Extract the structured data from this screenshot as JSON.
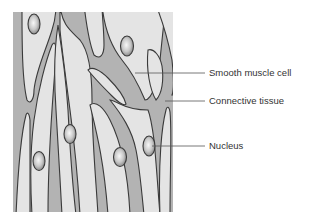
{
  "diagram": {
    "colors": {
      "connective_tissue": "#b3b3b3",
      "cell": "#e4e4e4",
      "outline": "#3a3a3a",
      "nucleus_light": "#f6f6f6",
      "nucleus_dark": "#8a8a8a",
      "leader_line": "#555555",
      "label_text": "#333333"
    },
    "labels": [
      {
        "id": "smooth-muscle-cell",
        "text": "Smooth muscle cell",
        "x": 209,
        "y": 68
      },
      {
        "id": "connective-tissue",
        "text": "Connective tissue",
        "x": 209,
        "y": 96
      },
      {
        "id": "nucleus",
        "text": "Nucleus",
        "x": 209,
        "y": 141
      }
    ]
  }
}
